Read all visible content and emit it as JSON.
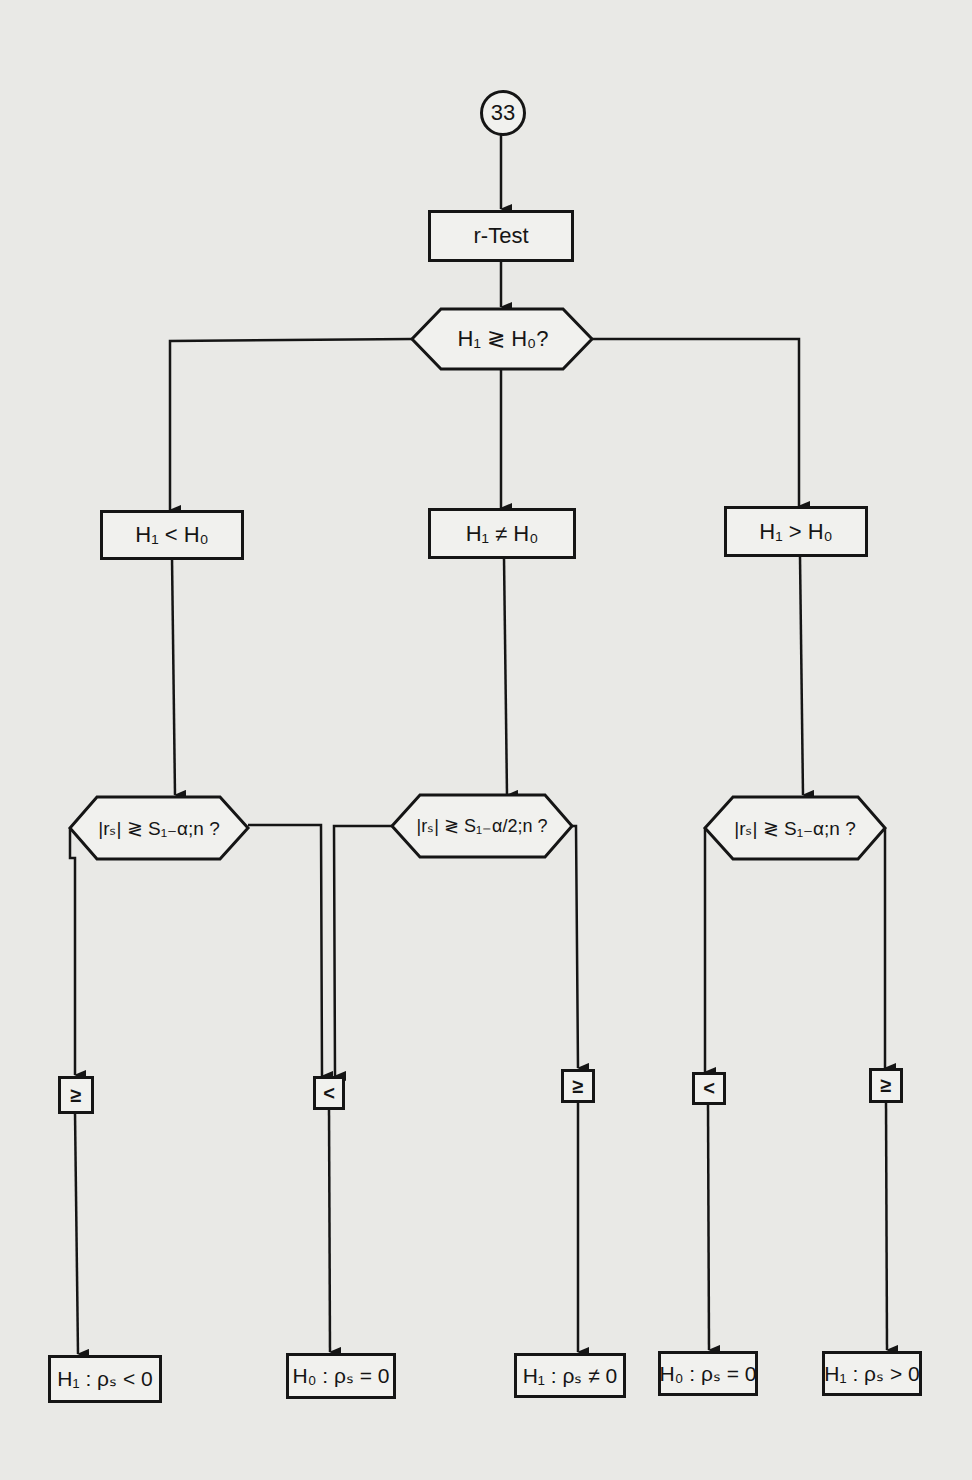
{
  "connector": {
    "label": "33"
  },
  "start": {
    "label": "r-Test"
  },
  "decision_main": {
    "label": "H₁ ≷ H₀?"
  },
  "branches": [
    {
      "label": "H₁ < H₀"
    },
    {
      "label": "H₁ ≠ H₀"
    },
    {
      "label": "H₁ > H₀"
    }
  ],
  "decisions": [
    {
      "label": "|rₛ| ≷ S₁₋α;n ?"
    },
    {
      "label": "|rₛ| ≷ S₁₋α/2;n ?"
    },
    {
      "label": "|rₛ| ≷ S₁₋α;n ?"
    }
  ],
  "conditions": [
    {
      "label": "≥"
    },
    {
      "label": "<"
    },
    {
      "label": "≥"
    },
    {
      "label": "<"
    },
    {
      "label": "≥"
    }
  ],
  "results": [
    {
      "label": "H₁ : ρₛ < 0"
    },
    {
      "label": "H₀ : ρₛ = 0"
    },
    {
      "label": "H₁ : ρₛ ≠ 0"
    },
    {
      "label": "H₀ : ρₛ = 0"
    },
    {
      "label": "H₁ : ρₛ > 0"
    }
  ]
}
